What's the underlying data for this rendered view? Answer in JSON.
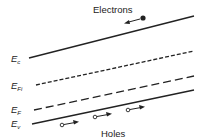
{
  "diagram": {
    "type": "energy-band-diagram",
    "labels": {
      "electrons": "Electrons",
      "holes": "Holes",
      "ec": {
        "main": "E",
        "sub": "c"
      },
      "efi": {
        "main": "E",
        "sub": "Fi"
      },
      "ef": {
        "main": "E",
        "sub": "F"
      },
      "ev": {
        "main": "E",
        "sub": "v"
      }
    },
    "lines": [
      {
        "name": "conduction-band-edge",
        "style": "solid"
      },
      {
        "name": "intrinsic-fermi-level",
        "style": "short-dash"
      },
      {
        "name": "fermi-level",
        "style": "long-dash"
      },
      {
        "name": "valence-band-edge",
        "style": "solid"
      }
    ],
    "colors": {
      "line": "#222222",
      "background": "#ffffff"
    }
  }
}
